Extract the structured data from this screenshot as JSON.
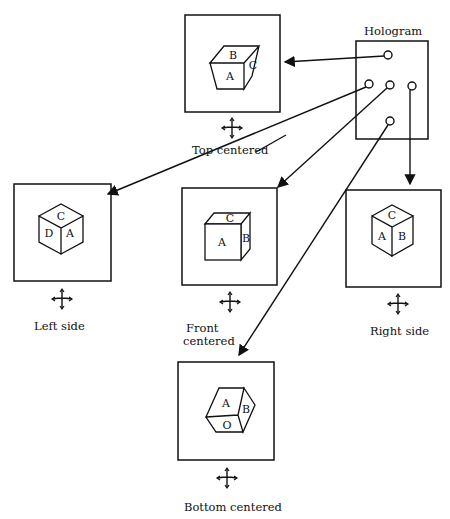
{
  "diagram": {
    "hologram": {
      "label": "Hologram",
      "viewpoints": 5
    },
    "views": [
      {
        "id": "top",
        "label": "Top centered",
        "faces": [
          "A",
          "B",
          "C"
        ]
      },
      {
        "id": "left",
        "label": "Left side",
        "faces": [
          "C",
          "D",
          "A"
        ]
      },
      {
        "id": "front",
        "label_line1": "Front",
        "label_line2": "centered",
        "faces": [
          "A",
          "B",
          "C"
        ]
      },
      {
        "id": "right",
        "label": "Right side",
        "faces": [
          "C",
          "A",
          "B"
        ]
      },
      {
        "id": "bottom",
        "label": "Bottom centered",
        "faces": [
          "A",
          "B",
          "O"
        ]
      }
    ]
  }
}
